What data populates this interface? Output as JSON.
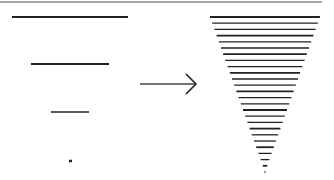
{
  "figure": {
    "colors": {
      "ink": "#222222",
      "border": "#8a8a8a",
      "background": "#ffffff"
    },
    "top_border": {
      "x1": 0,
      "x2": 322,
      "y": 2
    },
    "left_segments": [
      {
        "x1": 12,
        "x2": 128,
        "y": 17,
        "w": 2.2
      },
      {
        "x1": 31,
        "x2": 109,
        "y": 64,
        "w": 2.0
      },
      {
        "x1": 51,
        "x2": 89,
        "y": 112,
        "w": 1.5
      },
      {
        "x1": 69,
        "x2": 72,
        "y": 161,
        "w": 2.5
      }
    ],
    "arrow": {
      "x1": 140,
      "x2": 196,
      "y": 84,
      "head_size": 10
    },
    "triangle": {
      "top_y": 17,
      "bottom_y": 172,
      "top_left": 210,
      "top_right": 320,
      "apex_x": 265,
      "line_count": 26
    }
  }
}
